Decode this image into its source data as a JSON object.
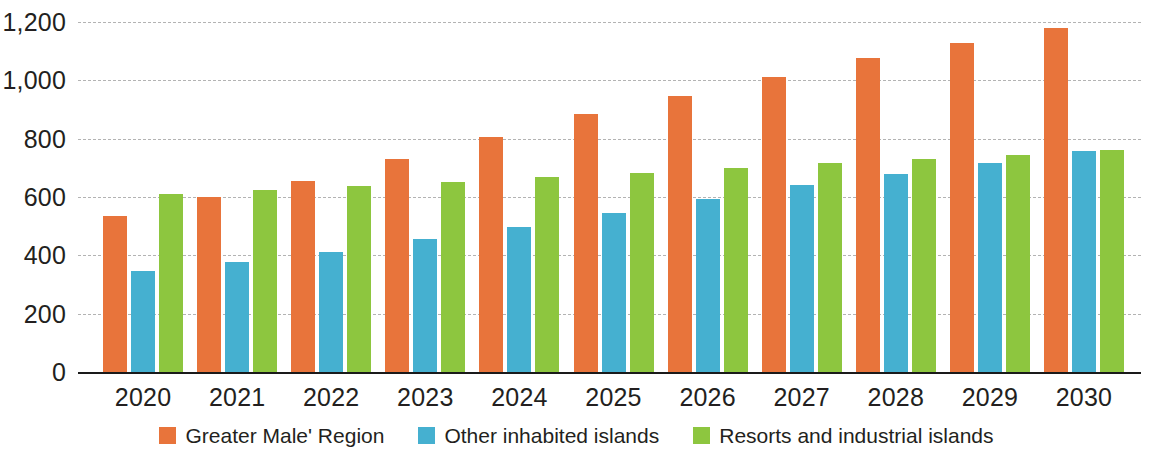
{
  "chart_data": {
    "type": "bar",
    "title": "",
    "subtitle": "",
    "xlabel": "",
    "ylabel": "",
    "categories": [
      "2020",
      "2021",
      "2022",
      "2023",
      "2024",
      "2025",
      "2026",
      "2027",
      "2028",
      "2029",
      "2030"
    ],
    "series": [
      {
        "name": "Greater Male' Region",
        "color": "#e8743b",
        "values": [
          535,
          600,
          655,
          730,
          805,
          885,
          948,
          1012,
          1075,
          1128,
          1180
        ]
      },
      {
        "name": "Other inhabited islands",
        "color": "#45b0d0",
        "values": [
          345,
          378,
          412,
          455,
          498,
          545,
          592,
          640,
          680,
          718,
          758
        ]
      },
      {
        "name": "Resorts and industrial islands",
        "color": "#8dc63f",
        "values": [
          612,
          625,
          638,
          652,
          668,
          682,
          700,
          715,
          730,
          745,
          760
        ]
      }
    ],
    "ylim": [
      0,
      1200
    ],
    "y_ticks": [
      0,
      200,
      400,
      600,
      800,
      1000,
      1200
    ],
    "y_tick_labels": [
      "0",
      "200",
      "400",
      "600",
      "800",
      "1,000",
      "1,200"
    ],
    "grid": true,
    "grid_style": "dashed",
    "legend_position": "bottom"
  },
  "legend": {
    "items": [
      {
        "label": "Greater Male' Region",
        "swatch": "legend-swatch-orange"
      },
      {
        "label": "Other inhabited islands",
        "swatch": "legend-swatch-blue"
      },
      {
        "label": "Resorts and industrial islands",
        "swatch": "legend-swatch-green"
      }
    ]
  },
  "colors": {
    "series_1": "#e8743b",
    "series_2": "#45b0d0",
    "series_3": "#8dc63f",
    "axis": "#1a1a1a",
    "grid": "#9a9a9a",
    "text": "#231f20",
    "background": "#ffffff"
  }
}
